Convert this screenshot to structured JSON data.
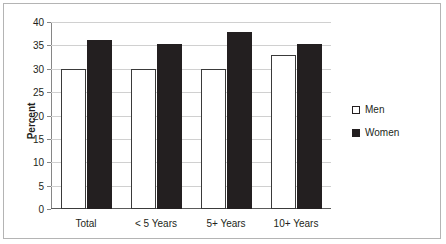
{
  "chart_data": {
    "type": "bar",
    "title": "",
    "xlabel": "",
    "ylabel": "Percent",
    "ylim": [
      0,
      40
    ],
    "yticks": [
      0,
      5,
      10,
      15,
      20,
      25,
      30,
      35,
      40
    ],
    "grid": true,
    "legend_position": "right",
    "categories": [
      "Total",
      "< 5 Years",
      "5+ Years",
      "10+ Years"
    ],
    "series": [
      {
        "name": "Men",
        "color": "#ffffff",
        "values": [
          30.0,
          30.0,
          30.0,
          33.0
        ]
      },
      {
        "name": "Women",
        "color": "#231f20",
        "values": [
          36.2,
          35.2,
          37.8,
          35.4
        ]
      }
    ]
  },
  "legend": {
    "items": [
      {
        "label": "Men"
      },
      {
        "label": "Women"
      }
    ]
  },
  "colors": {
    "men_fill": "#ffffff",
    "women_fill": "#231f20",
    "gridline": "#d0d0d0",
    "axis": "#868686",
    "frame": "#b4b4b4",
    "text": "#231f20"
  }
}
